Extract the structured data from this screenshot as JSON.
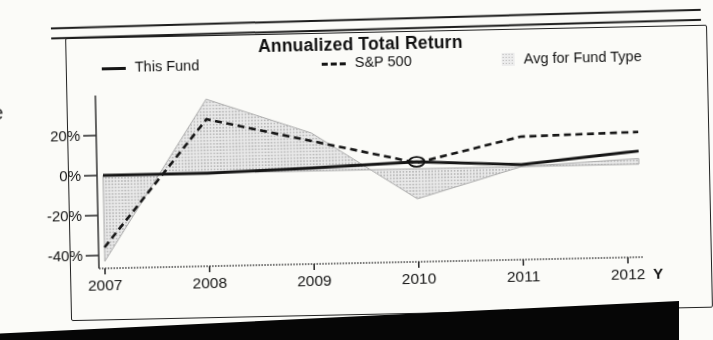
{
  "document": {
    "left_edge_fragments": {
      "line1": "t",
      "line2": "e"
    }
  },
  "chart": {
    "title": "Annualized Total Return",
    "legend": [
      {
        "label": "This Fund",
        "swatch": "solid-line"
      },
      {
        "label": "S&P 500",
        "swatch": "dashed-line"
      },
      {
        "label": "Avg for Fund Type",
        "swatch": "shaded-area"
      }
    ],
    "x_axis": {
      "tick_labels": [
        "2007",
        "2008",
        "2009",
        "2010",
        "2011",
        "2012"
      ],
      "suffix_label": "Y"
    },
    "y_axis": {
      "tick_labels": [
        "20%",
        "0%",
        "-20%",
        "-40%"
      ]
    }
  },
  "chart_data": {
    "type": "line",
    "title": "Annualized Total Return",
    "x": [
      2007,
      2008,
      2009,
      2010,
      2011,
      2012
    ],
    "unit": "percent",
    "ylim": [
      -47,
      38
    ],
    "y_tick_values": [
      20,
      0,
      -20,
      -40
    ],
    "grid": false,
    "legend_position": "top",
    "series": [
      {
        "name": "This Fund",
        "type": "line",
        "style": "solid",
        "values": [
          0,
          0,
          1.5,
          3.5,
          1,
          6
        ]
      },
      {
        "name": "S&P 500",
        "type": "line",
        "style": "dashed",
        "values": [
          -36,
          27,
          15,
          3,
          15,
          16
        ]
      },
      {
        "name": "Avg for Fund Type",
        "type": "area",
        "baseline": 0,
        "values": [
          -43,
          37,
          19,
          -15,
          0,
          2.5
        ]
      }
    ],
    "annotations": [
      {
        "type": "ellipse-highlight",
        "x": 2010,
        "y": 3.5,
        "note": "circled intersection of This Fund and S&P 500"
      }
    ]
  },
  "colors": {
    "ink": "#161616",
    "area_fill_dot": "#b5b5b5",
    "area_fill_bg": "#ececec",
    "area_edge": "#ababab",
    "paper": "#fbfbf8",
    "scan_edge": "#060606"
  }
}
